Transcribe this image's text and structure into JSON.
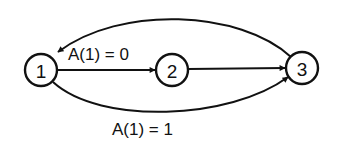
{
  "diagram": {
    "type": "state-transition-graph",
    "nodes": [
      {
        "id": "1",
        "label": "1"
      },
      {
        "id": "2",
        "label": "2"
      },
      {
        "id": "3",
        "label": "3"
      }
    ],
    "edges": [
      {
        "from": "1",
        "to": "2",
        "label": "A(1) = 0",
        "shape": "straight"
      },
      {
        "from": "2",
        "to": "3",
        "label": "",
        "shape": "straight"
      },
      {
        "from": "1",
        "to": "3",
        "label": "A(1) = 1",
        "shape": "curve-below"
      },
      {
        "from": "3",
        "to": "1",
        "label": "",
        "shape": "curve-above"
      }
    ],
    "colors": {
      "stroke": "#111111",
      "background": "#ffffff"
    }
  }
}
